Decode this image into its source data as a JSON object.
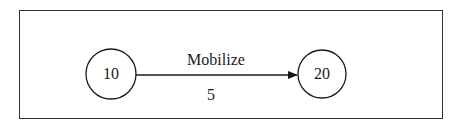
{
  "diagram": {
    "type": "activity-on-arrow network",
    "nodes": [
      {
        "id": "10",
        "label": "10"
      },
      {
        "id": "20",
        "label": "20"
      }
    ],
    "edges": [
      {
        "from": "10",
        "to": "20",
        "activity": "Mobilize",
        "duration": "5"
      }
    ]
  },
  "colors": {
    "stroke": "#1a1a1a",
    "background": "#ffffff"
  }
}
